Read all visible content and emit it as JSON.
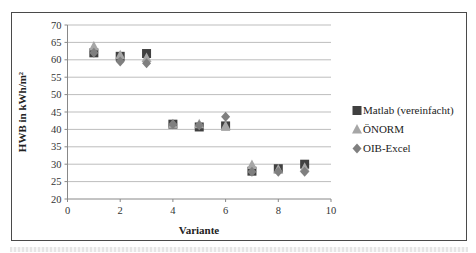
{
  "chart_data": {
    "type": "scatter",
    "title": "",
    "xlabel": "Variante",
    "ylabel": "HWB in kWh/m²",
    "xlim": [
      0,
      10
    ],
    "ylim": [
      20,
      70
    ],
    "x_ticks": [
      0,
      2,
      4,
      6,
      8,
      10
    ],
    "y_ticks": [
      20,
      25,
      30,
      35,
      40,
      45,
      50,
      55,
      60,
      65,
      70
    ],
    "grid": "horizontal",
    "legend_position": "right",
    "x": [
      1,
      2,
      3,
      4,
      5,
      6,
      7,
      8,
      9
    ],
    "series": [
      {
        "name": "Matlab (vereinfacht)",
        "marker": "square",
        "color": "#404040",
        "values": [
          62,
          61,
          61.8,
          41.5,
          40.7,
          41,
          28,
          28.7,
          30
        ]
      },
      {
        "name": "ÖNORM",
        "marker": "triangle",
        "color": "#a6a6a6",
        "values": [
          63.8,
          61.3,
          60.5,
          41.5,
          41.5,
          41,
          29.8,
          28.5,
          29
        ]
      },
      {
        "name": "OIB-Excel",
        "marker": "diamond",
        "color": "#7f7f7f",
        "values": [
          62,
          59.5,
          59,
          41.5,
          41.2,
          43.6,
          27.8,
          27.8,
          27.8
        ]
      }
    ]
  }
}
